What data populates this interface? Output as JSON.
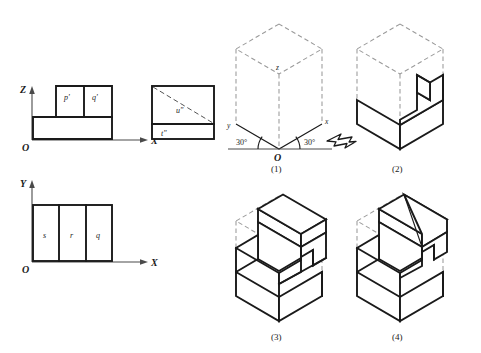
{
  "figure": {
    "background_color": "#ffffff",
    "line_color": "#1a1a1a",
    "hidden_line_color": "#9a9a9a"
  },
  "orthographic": {
    "front_view": {
      "name": "front-view",
      "axis_vertical": "Z",
      "axis_horizontal": "X",
      "origin": "O",
      "face_labels": [
        "p'",
        "q'"
      ]
    },
    "side_view": {
      "name": "side-view",
      "face_labels": [
        "u\"",
        "t\""
      ]
    },
    "top_view": {
      "name": "top-view",
      "axis_vertical": "Y",
      "axis_horizontal": "X",
      "origin": "O",
      "face_labels": [
        "s",
        "r",
        "q"
      ]
    }
  },
  "isometric_options": [
    {
      "number": "(1)",
      "name": "option-1-axes-cube",
      "axis_labels": {
        "x": "x",
        "y": "y",
        "z": "z",
        "origin": "O"
      },
      "angles": [
        "30°",
        "30°"
      ],
      "viewing_arrow": "arrow-icon"
    },
    {
      "number": "(2)",
      "name": "option-2-solid"
    },
    {
      "number": "(3)",
      "name": "option-3-solid"
    },
    {
      "number": "(4)",
      "name": "option-4-solid"
    }
  ]
}
